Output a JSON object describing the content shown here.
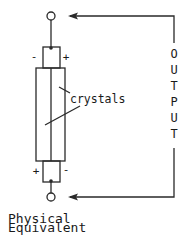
{
  "diagram": {
    "labels": {
      "crystals": "crystals",
      "caption_line1": "Physical",
      "caption_line2": "Equivalent",
      "output_letters": [
        "O",
        "U",
        "T",
        "P",
        "U",
        "T"
      ]
    },
    "polarity": {
      "top_left": "-",
      "top_right": "+",
      "bottom_left": "+",
      "bottom_right": "-"
    },
    "colors": {
      "stroke": "#2a2a2a",
      "text": "#1a1a1a",
      "background": "#ffffff"
    }
  }
}
